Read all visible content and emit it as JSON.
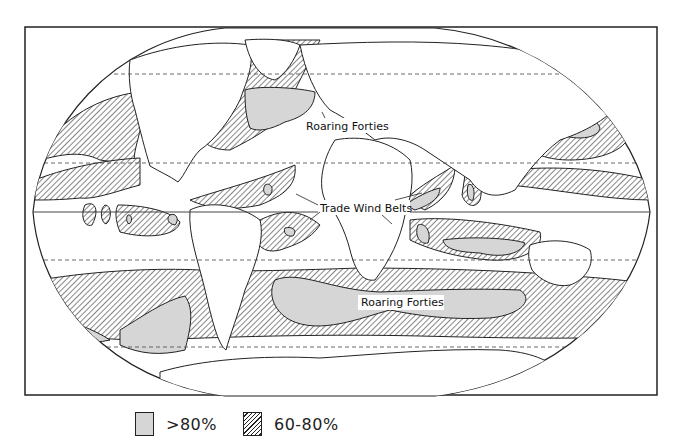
{
  "figure": {
    "type": "world-map",
    "projection": "oval world map (Winkel-like) with flat poles",
    "colors": {
      "background": "#ffffff",
      "ink": "#222222",
      "high_fill": "#d6d6d6",
      "hatch": "#222222"
    }
  },
  "labels": {
    "roaring_forties_north": "Roaring Forties",
    "trade_wind_belts": "Trade Wind Belts",
    "roaring_forties_south": "Roaring Forties"
  },
  "graticule": {
    "equator": "solid",
    "tropics_and_polar_circles": "dashed"
  },
  "legend": {
    "items": [
      {
        "label": ">80%",
        "style": "solid-gray"
      },
      {
        "label": "60-80%",
        "style": "diagonal-hatch"
      }
    ]
  }
}
